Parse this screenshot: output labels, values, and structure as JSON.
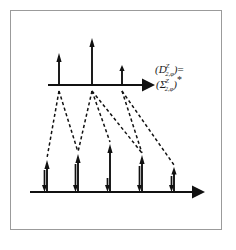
{
  "figure": {
    "name": "wavelet-coefficient-tree-diagram",
    "background_color": "#ffffff",
    "frame_color": "#9b9b9b",
    "ink_color": "#111111",
    "formula": {
      "line1": {
        "open_paren": "(",
        "symbol": "D",
        "superscript": "Z",
        "subscript": "2,φ",
        "close_paren": ")",
        "equals": "="
      },
      "line2": {
        "open_paren": "(",
        "symbol": "Σ",
        "superscript": "Z",
        "subscript": "2,φ",
        "close_paren": ")",
        "conjugate_star": "*"
      }
    },
    "axes": [
      {
        "id": "top-axis",
        "label": "upper-level-axis",
        "x_start": 48,
        "x_end": 148,
        "y": 85,
        "arrowhead": "right"
      },
      {
        "id": "bottom-axis",
        "label": "lower-level-axis",
        "x_start": 30,
        "x_end": 198,
        "y": 192,
        "arrowhead": "right"
      }
    ],
    "top_impulses": [
      {
        "x": 59,
        "height": 32,
        "direction": "up"
      },
      {
        "x": 92,
        "height": 47,
        "direction": "up"
      },
      {
        "x": 122,
        "height": 20,
        "direction": "up"
      }
    ],
    "bottom_impulses": [
      {
        "x": 47,
        "up_height": 32,
        "down_height": 22
      },
      {
        "x": 78,
        "up_height": 38,
        "down_height": 28
      },
      {
        "x": 110,
        "up_height": 48,
        "down_height": 14
      },
      {
        "x": 142,
        "up_height": 37,
        "down_height": 26
      },
      {
        "x": 174,
        "up_height": 25,
        "down_height": 16
      }
    ],
    "dashed_connections": [
      {
        "from_top_index": 0,
        "to_bottom_index": 0
      },
      {
        "from_top_index": 0,
        "to_bottom_index": 1
      },
      {
        "from_top_index": 1,
        "to_bottom_index": 1
      },
      {
        "from_top_index": 1,
        "to_bottom_index": 2
      },
      {
        "from_top_index": 1,
        "to_bottom_index": 3
      },
      {
        "from_top_index": 2,
        "to_bottom_index": 3
      },
      {
        "from_top_index": 2,
        "to_bottom_index": 4
      }
    ]
  }
}
